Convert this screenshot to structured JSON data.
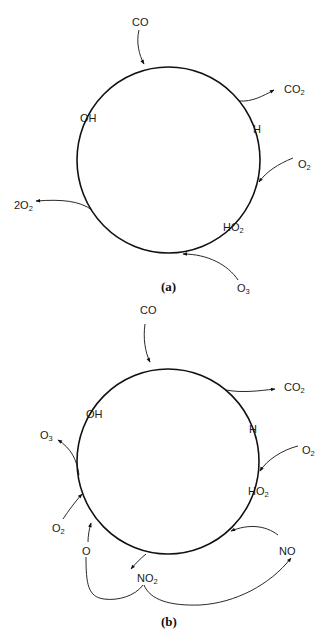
{
  "figure": {
    "panels": [
      {
        "id": "a",
        "caption": "(a)",
        "cycle_species": {
          "oh": "OH",
          "h": "H",
          "ho2_base": "HO",
          "ho2_sub": "2"
        },
        "inputs": {
          "co": "CO",
          "o2_base": "O",
          "o2_sub": "2",
          "o3_base": "O",
          "o3_sub": "3"
        },
        "outputs": {
          "co2_base": "CO",
          "co2_sub": "2",
          "two_o2_base": "2O",
          "two_o2_sub": "2"
        }
      },
      {
        "id": "b",
        "caption": "(b)",
        "cycle_species": {
          "oh": "OH",
          "h": "H",
          "ho2_base": "HO",
          "ho2_sub": "2"
        },
        "inputs": {
          "co": "CO",
          "o2_right_base": "O",
          "o2_right_sub": "2",
          "o2_left_base": "O",
          "o2_left_sub": "2",
          "no": "NO",
          "o": "O"
        },
        "outputs": {
          "co2_base": "CO",
          "co2_sub": "2",
          "o3_base": "O",
          "o3_sub": "3",
          "no2_base": "NO",
          "no2_sub": "2"
        }
      }
    ]
  }
}
